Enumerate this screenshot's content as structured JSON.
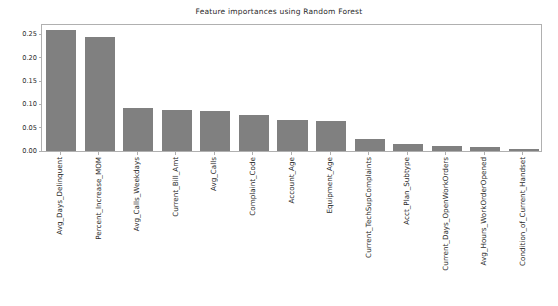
{
  "chart_data": {
    "type": "bar",
    "title": "Feature importances using Random Forest",
    "xlabel": "",
    "ylabel": "",
    "ylim": [
      0.0,
      0.27
    ],
    "yticks": [
      "0.00",
      "0.05",
      "0.10",
      "0.15",
      "0.20",
      "0.25"
    ],
    "ytick_values": [
      0.0,
      0.05,
      0.1,
      0.15,
      0.2,
      0.25
    ],
    "grid": false,
    "legend": null,
    "bar_color": "#808080",
    "background_color": "#ffffff",
    "axis_color": "#b0b0b0",
    "categories": [
      "Avg_Days_Delinquent",
      "Percent_Increase_MOM",
      "Avg_Calls_Weekdays",
      "Current_Bill_Amt",
      "Avg_Calls",
      "Complaint_Code",
      "Account_Age",
      "Equipment_Age",
      "Current_TechSupComplaints",
      "Acct_Plan_Subtype",
      "Current_Days_OpenWorkOrders",
      "Avg_Hours_WorkOrderOpened",
      "Condition_of_Current_Handset"
    ],
    "values": [
      0.259,
      0.245,
      0.092,
      0.087,
      0.086,
      0.077,
      0.066,
      0.064,
      0.026,
      0.014,
      0.011,
      0.009,
      0.005
    ]
  }
}
